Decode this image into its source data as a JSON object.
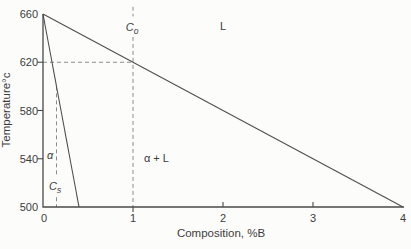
{
  "figure": {
    "background": "#fcfcfb"
  },
  "chart_data": {
    "type": "line",
    "title": "",
    "xlabel": "Composition, %B",
    "ylabel": "Temperature°c",
    "xlim": [
      0,
      4
    ],
    "ylim": [
      500,
      660
    ],
    "x_ticks": [
      0,
      1,
      2,
      3,
      4
    ],
    "y_ticks": [
      500,
      540,
      580,
      620,
      660
    ],
    "grid": false,
    "legend": "none",
    "series": [
      {
        "name": "liquidus",
        "points": [
          [
            0,
            660
          ],
          [
            4,
            500
          ]
        ]
      },
      {
        "name": "solidus",
        "points": [
          [
            0,
            660
          ],
          [
            0.4,
            500
          ]
        ]
      }
    ],
    "construction_lines": [
      {
        "name": "tie-line-620",
        "style": "dashed",
        "segments": [
          [
            [
              0,
              620
            ],
            [
              1,
              620
            ]
          ]
        ]
      },
      {
        "name": "c0-composition-line",
        "style": "dashed",
        "segments": [
          [
            [
              1,
              666
            ],
            [
              1,
              658
            ]
          ],
          [
            [
              1,
              641
            ],
            [
              1,
              500
            ]
          ]
        ]
      },
      {
        "name": "cs-composition-line",
        "style": "dashed",
        "segments": [
          [
            [
              0.15,
              600
            ],
            [
              0.15,
              525
            ]
          ],
          [
            [
              0.15,
              508
            ],
            [
              0.15,
              500
            ]
          ]
        ]
      }
    ],
    "region_labels": [
      {
        "name": "label-liquid",
        "text": "L",
        "x": 2.0,
        "y": 650,
        "italic": false
      },
      {
        "name": "label-c0",
        "text": "C",
        "sub": "o",
        "x": 0.99,
        "y": 649,
        "italic": true
      },
      {
        "name": "label-alpha-plus-liquid",
        "text": "α + L",
        "x": 1.26,
        "y": 541,
        "italic": false
      },
      {
        "name": "label-alpha",
        "text": "α",
        "x": 0.08,
        "y": 543,
        "italic": true
      },
      {
        "name": "label-cs",
        "text": "C",
        "sub": "s",
        "x": 0.135,
        "y": 517,
        "italic": true
      }
    ],
    "colors": {
      "axis": "#4a4a4a",
      "line": "#4f4f4f",
      "dashed": "#8c8c8c",
      "text": "#3c3c3c"
    }
  }
}
